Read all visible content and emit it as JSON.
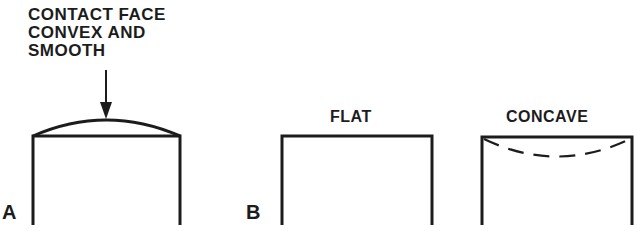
{
  "diagram": {
    "panel_a": {
      "letter": "A",
      "callout_lines": [
        "CONTACT FACE",
        "CONVEX AND",
        "SMOOTH"
      ],
      "shape": "convex"
    },
    "panel_b": {
      "letter": "B",
      "shapes": [
        {
          "title": "FLAT",
          "shape": "flat"
        },
        {
          "title": "CONCAVE",
          "shape": "concave"
        }
      ]
    },
    "stroke_color": "#1c1c1c",
    "background_color": "#ffffff"
  }
}
